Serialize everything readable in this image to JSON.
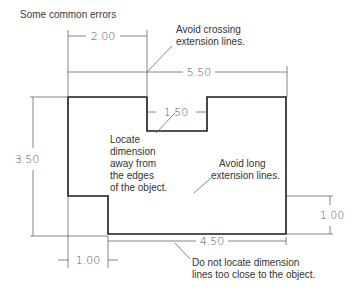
{
  "figure": {
    "title": "Some common errors",
    "dimensions": {
      "top_2_00": "2.00",
      "overall_5_50": "5.50",
      "notch_1_50": "1.50",
      "height_3_50": "3.50",
      "right_1_00": "1.00",
      "bottom_4_50": "4.50",
      "bottom_1_00": "1.00"
    },
    "notes": {
      "crossing": [
        "Avoid crossing",
        "extension lines."
      ],
      "locate_away": [
        "Locate",
        "dimension",
        "away from",
        "the edges",
        "of the object."
      ],
      "long_ext": [
        "Avoid long",
        "extension lines."
      ],
      "too_close": [
        "Do not locate dimension",
        "lines too close to the object."
      ]
    },
    "colors": {
      "object_line": "#1a1a1a",
      "dimension_line": "#555555",
      "text": "#333333"
    }
  }
}
